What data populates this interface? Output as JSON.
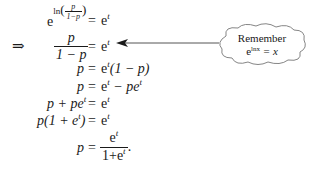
{
  "implies_symbol": "⇒",
  "steps": [
    {
      "lhs_base": "e",
      "lhs_exp_fn": "ln",
      "lhs_exp_num": "p",
      "lhs_exp_den": "1−p",
      "eq": "=",
      "rhs_base": "e",
      "rhs_exp": "t"
    },
    {
      "lhs_num": "p",
      "lhs_den": "1 − p",
      "eq": "=",
      "rhs_base": "e",
      "rhs_exp": "t"
    },
    {
      "lhs": "p",
      "eq": "=",
      "rhs_base": "e",
      "rhs_exp": "t",
      "rhs_tail": "(1 − p)"
    },
    {
      "lhs": "p",
      "eq": "=",
      "rhs_base": "e",
      "rhs_exp": "t",
      "rhs_mid": " − pe",
      "rhs_exp2": "t"
    },
    {
      "lhs_a": "p + pe",
      "lhs_exp": "t",
      "eq": "=",
      "rhs_base": "e",
      "rhs_exp": "t"
    },
    {
      "lhs_a": "p(1 + e",
      "lhs_exp": "t",
      "lhs_b": ")",
      "eq": "=",
      "rhs_base": "e",
      "rhs_exp": "t"
    },
    {
      "lhs": "p",
      "eq": "=",
      "rhs_num_base": "e",
      "rhs_num_exp": "t",
      "rhs_den_a": "1+e",
      "rhs_den_exp": "t",
      "trail": "."
    }
  ],
  "callout": {
    "line1": "Remember",
    "line2_base": "e",
    "line2_exp": "lnx",
    "line2_rest": " = x"
  },
  "colors": {
    "ink": "#1a1a1a",
    "line": "#555555"
  }
}
